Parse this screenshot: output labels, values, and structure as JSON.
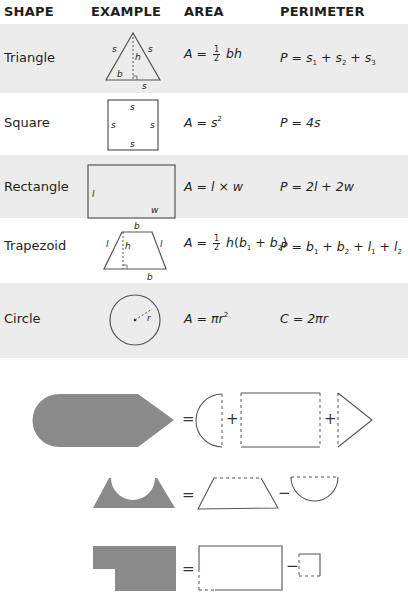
{
  "header": {
    "shape": "SHAPE",
    "example": "EXAMPLE",
    "area": "AREA",
    "perimeter": "PERIMETER"
  },
  "rows": [
    {
      "shape": "Triangle",
      "example_labels": [
        "s",
        "s",
        "h",
        "b",
        "s"
      ],
      "area": {
        "lhs": "A =",
        "frac_num": "1",
        "frac_den": "2",
        "rhs": "bh"
      },
      "perimeter": "P = s1 + s2 + s3"
    },
    {
      "shape": "Square",
      "example_labels": [
        "s",
        "s",
        "s",
        "s"
      ],
      "area": "A = s²",
      "perimeter": "P = 4s"
    },
    {
      "shape": "Rectangle",
      "example_labels": [
        "l",
        "w"
      ],
      "area": "A = l × w",
      "perimeter": "P = 2l + 2w"
    },
    {
      "shape": "Trapezoid",
      "example_labels": [
        "b",
        "l",
        "h",
        "l",
        "b"
      ],
      "area": {
        "lhs": "A =",
        "frac_num": "1",
        "frac_den": "2",
        "rhs": "h(b1 + b2)"
      },
      "perimeter": "P = b1 + b2 + l1 + l2"
    },
    {
      "shape": "Circle",
      "example_labels": [
        "r"
      ],
      "area": "A = πr²",
      "perimeter": "C = 2πr"
    }
  ],
  "composites": [
    {
      "name": "pencil-shape",
      "equation": [
        "=",
        "+",
        "+"
      ],
      "parts": [
        "semicircle",
        "rectangle",
        "triangle"
      ]
    },
    {
      "name": "trapezoid-minus-semicircle",
      "equation": [
        "=",
        "−"
      ],
      "parts": [
        "trapezoid",
        "semicircle"
      ]
    },
    {
      "name": "rectangle-minus-square",
      "equation": [
        "=",
        "−"
      ],
      "parts": [
        "rectangle",
        "square"
      ]
    }
  ],
  "colors": {
    "band_gray": "#ececec",
    "shape_fill": "#8a8a8a",
    "stroke": "#555555",
    "text": "#231f20"
  }
}
